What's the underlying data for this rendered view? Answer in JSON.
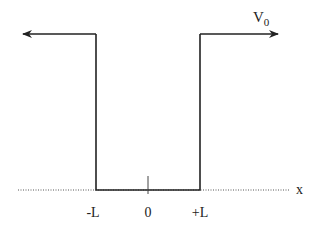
{
  "diagram": {
    "type": "finite-square-well",
    "potential_label": "V",
    "potential_subscript": "0",
    "axis_label": "x",
    "tick_labels": {
      "left": "-L",
      "center": "0",
      "right": "+L"
    },
    "colors": {
      "line": "#222222",
      "axis": "#555555",
      "background": "#ffffff"
    }
  }
}
